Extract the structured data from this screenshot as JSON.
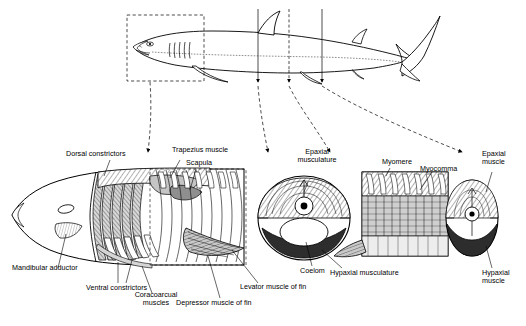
{
  "figure": {
    "type": "anatomical-diagram",
    "top_panel": {
      "name": "whole-shark-lateral-view",
      "section_marker_count": 3
    },
    "panels": [
      {
        "name": "anterior-musculature-detail"
      },
      {
        "name": "trunk-cross-section"
      },
      {
        "name": "myomere-block-detail"
      },
      {
        "name": "caudal-cross-section"
      }
    ]
  },
  "labels": {
    "dorsal_constrictors": "Dorsal constrictors",
    "trapezius_muscle": "Trapezius muscle",
    "scapula": "Scapula",
    "mandibular_adductor": "Mandibular adductor",
    "ventral_constrictors": "Ventral constrictors",
    "coracoarcual_muscles": "Coracoarcual\nmuscles",
    "coracoarcual_muscles_line1": "Coracoarcual",
    "coracoarcual_muscles_line2": "muscles",
    "depressor_muscle_of_fin": "Depressor muscle of fin",
    "levator_muscle_of_fin": "Levator muscle of fin",
    "epaxial_musculature_line1": "Epaxial",
    "epaxial_musculature_line2": "musculature",
    "coelom": "Coelom",
    "hypaxial_musculature": "Hypaxial musculature",
    "myomere": "Myomere",
    "myocomma": "Myocomma",
    "epaxial_muscle_line1": "Epaxial",
    "epaxial_muscle_line2": "muscle",
    "hypaxial_muscle_line1": "Hypaxial",
    "hypaxial_muscle_line2": "muscle"
  },
  "colors": {
    "ink": "#000000",
    "background": "#ffffff",
    "shading": "#b9b9b9",
    "mid_shading": "#8d8d8d",
    "dark_shading": "#4a4a4a"
  }
}
